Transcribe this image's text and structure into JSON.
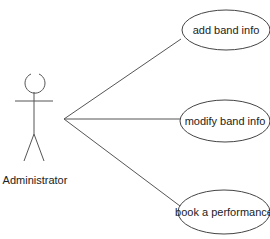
{
  "diagram": {
    "type": "use-case",
    "actor": {
      "name": "Administrator",
      "icon": "stick-figure-icon"
    },
    "use_cases": [
      {
        "label": "add band info"
      },
      {
        "label": "modify band info"
      },
      {
        "label": "book a performance"
      }
    ],
    "associations": [
      {
        "from": "Administrator",
        "to": "add band info"
      },
      {
        "from": "Administrator",
        "to": "modify band info"
      },
      {
        "from": "Administrator",
        "to": "book a performance"
      }
    ],
    "colors": {
      "line": "#555555",
      "text": "#222222",
      "background": "#ffffff"
    }
  }
}
